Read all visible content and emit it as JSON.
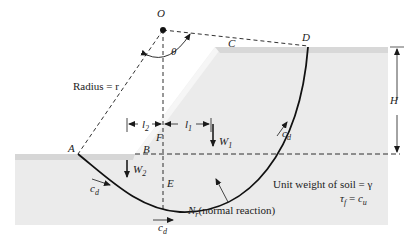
{
  "diagram": {
    "points": {
      "O": "O",
      "A": "A",
      "B": "B",
      "C": "C",
      "D": "D",
      "E": "E",
      "F": "F"
    },
    "angle": "θ",
    "radius_label": "Radius = r",
    "height_label": "H",
    "lever_arms": {
      "l1": "l",
      "l1_sub": "1",
      "l2": "l",
      "l2_sub": "2"
    },
    "weights": {
      "W1": "W",
      "W1_sub": "1",
      "W2": "W",
      "W2_sub": "2"
    },
    "cohesion": {
      "symbol": "c",
      "sub": "d"
    },
    "normal_reaction": {
      "symbol": "N",
      "sub": "r",
      "text": "(normal reaction)"
    },
    "soil_props": {
      "line1": "Unit weight of soil = γ",
      "line2_lhs": "τ",
      "line2_lhs_sub": "f",
      "line2_eq": " = ",
      "line2_rhs": "c",
      "line2_rhs_sub": "u"
    },
    "colors": {
      "soil": "#e6e6e6",
      "soil_edge": "#cfcfcf",
      "line": "#1a1a1a"
    }
  }
}
